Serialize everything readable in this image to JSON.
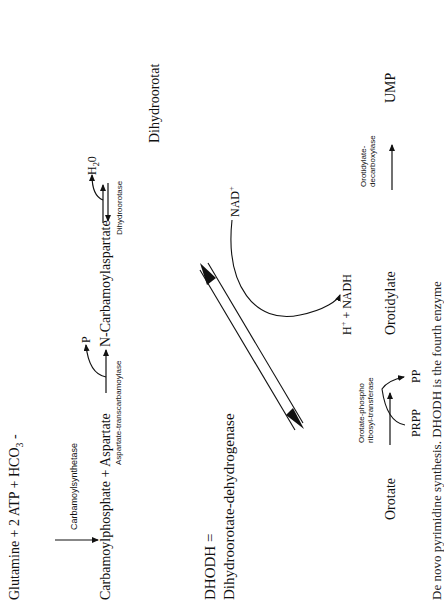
{
  "diagram": {
    "orientation": "rotated 90deg counter-clockwise",
    "step1": {
      "reactants": "Glutamine + 2 ATP + HCO",
      "reactants_sub": "3",
      "reactants_suffix": " -",
      "enzyme": "Carbamoylsynthetase"
    },
    "step2": {
      "reactants": "Carbamoylphosphate + Aspartate",
      "enzyme": "Aspartate-transcarbamoylase",
      "byproduct": "P",
      "product": "N-Carbamoylaspartate"
    },
    "step3": {
      "enzyme": "Dihydroorotase",
      "byproduct": "H",
      "byproduct_sub": "2",
      "byproduct_suffix": "0",
      "product": "Dihydroorotat"
    },
    "step4": {
      "abbrev_line": "DHODH =",
      "enzyme_full": "Dihydroorotate-dehydrogenase",
      "cofactor_in": "NAD",
      "cofactor_in_sup": "+",
      "cofactor_out_prefix": "H",
      "cofactor_out_sup": "+",
      "cofactor_out_suffix": " + NADH"
    },
    "step5": {
      "substrate": "Orotate",
      "enzyme_line1": "Orotate-phospho",
      "enzyme_line2": "ribosyl-transferase",
      "cosubstrate": "PRPP",
      "byproduct": "PP",
      "product": "Orotidylate"
    },
    "step6": {
      "enzyme_line1": "Orotidylate-",
      "enzyme_line2": "decarboxylase",
      "product": "UMP"
    },
    "caption": "De novo pyrimidine synthesis. DHODH is the fourth enzyme"
  },
  "colors": {
    "ink": "#111111",
    "background": "#ffffff"
  }
}
